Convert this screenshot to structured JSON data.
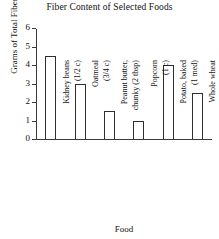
{
  "chart_data": {
    "type": "bar",
    "title": "Fiber Content of Selected Foods",
    "xlabel": "Food",
    "ylabel": "Grams of Total Fiber",
    "categories": [
      "Kidney beans (1/2 c)",
      "Oatmeal (3/4 c)",
      "Peanut butter, chunky (2 tbsp)",
      "Popcorn (1 c)",
      "Potato, baked (1 med)",
      "Whole wheat bread (1 slice)"
    ],
    "category_lines": [
      {
        "line1": "Kidney beans",
        "line2": "(1/2 c)"
      },
      {
        "line1": "Oatmeal",
        "line2": "(3/4 c)"
      },
      {
        "line1": "Peanut butter,",
        "line2": "chunky (2 tbsp)"
      },
      {
        "line1": "Popcorn",
        "line2": "(1 c)"
      },
      {
        "line1": "Potato, baked",
        "line2": "(1 med)"
      },
      {
        "line1": "Whole wheat",
        "line2": "bread (1 slice)"
      }
    ],
    "values": [
      4.5,
      3.0,
      1.5,
      1.0,
      4.0,
      2.5
    ],
    "ylim": [
      0,
      6
    ],
    "yticks": [
      0,
      1,
      2,
      3,
      4,
      5,
      6
    ],
    "ytick_labels": [
      "0",
      "1",
      "2",
      "3",
      "4",
      "5",
      "6"
    ],
    "grid": false,
    "legend": null,
    "bar_color": "#ffffff",
    "bar_edge_color": "#2e2e2e",
    "axis_color": "#3a3a3a",
    "background": "#ffffff"
  }
}
